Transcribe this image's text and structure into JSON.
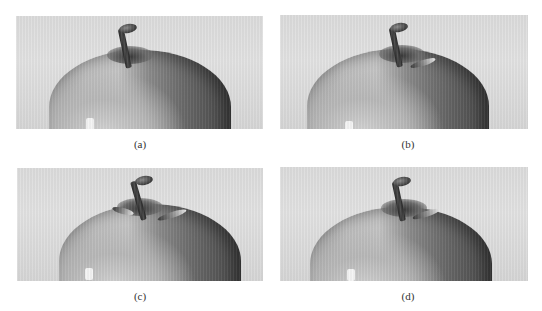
{
  "figure": {
    "panels": [
      {
        "id": "a",
        "label": "(a)",
        "description": "Grayscale close-up of apple top with stem",
        "has_leaf": false
      },
      {
        "id": "b",
        "label": "(b)",
        "description": "Grayscale close-up of apple top with stem and small leaf",
        "has_leaf": true
      },
      {
        "id": "c",
        "label": "(c)",
        "description": "Grayscale close-up of apple top with stem and leaf",
        "has_leaf": true
      },
      {
        "id": "d",
        "label": "(d)",
        "description": "Grayscale close-up of apple top with stem, leaf, and streaked shading",
        "has_leaf": true
      }
    ]
  },
  "colors": {
    "background": "#ffffff",
    "panel_background": "#dcdcdc",
    "apple_dark": "#474747",
    "apple_light": "#c4c4c4",
    "stem": "#2a2a2a",
    "caption": "#333333"
  }
}
